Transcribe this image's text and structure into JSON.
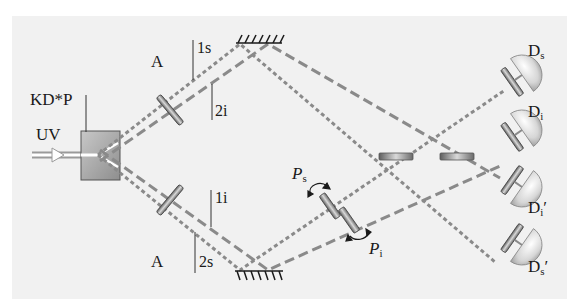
{
  "figure": {
    "crystal": {
      "label": "KD*P"
    },
    "source": {
      "label": "UV"
    },
    "apertures": {
      "top_label": "A",
      "bottom_label": "A"
    },
    "beams": {
      "top_upper": "1s",
      "top_lower": "2i",
      "bottom_upper": "1i",
      "bottom_lower": "2s"
    },
    "phase_plates": {
      "signal": {
        "symbol": "P",
        "subscript": "s"
      },
      "idler": {
        "symbol": "P",
        "subscript": "i"
      }
    },
    "detectors": [
      {
        "symbol": "D",
        "subscript": "s",
        "prime": ""
      },
      {
        "symbol": "D",
        "subscript": "i",
        "prime": ""
      },
      {
        "symbol": "D",
        "subscript": "i",
        "prime": "′"
      },
      {
        "symbol": "D",
        "subscript": "s",
        "prime": "′"
      }
    ],
    "colors": {
      "background": "#f1f1f1",
      "beam": "#8a8a8a",
      "outline": "#1a1a1a",
      "crystal_fill": "#a9a9a9"
    }
  }
}
